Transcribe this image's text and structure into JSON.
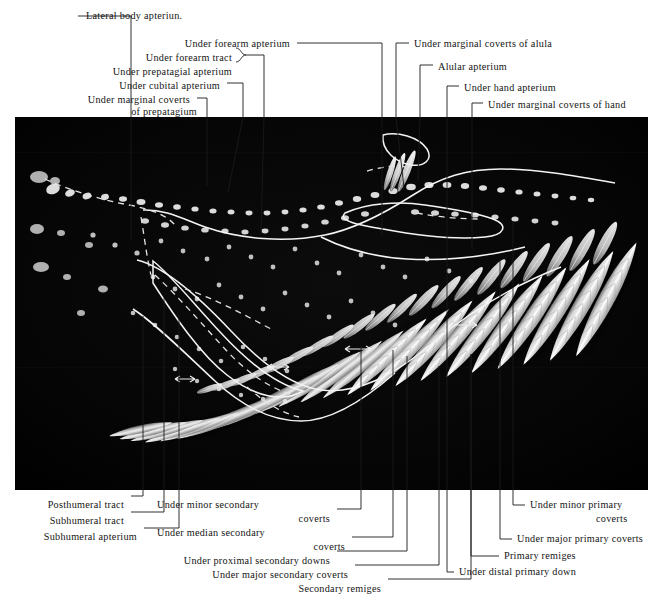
{
  "plate": {
    "domain": "anatomical-photographic-plate",
    "subject": "Underside of a bird wing showing feather tracts and apteria",
    "background_color": "#ffffff",
    "photo_color": "#000000",
    "ink_color": "#141414",
    "photo_rect": {
      "x": 15,
      "y": 117,
      "width": 633,
      "height": 373
    }
  },
  "labels_top": [
    {
      "id": "lateral-body-apterium",
      "text": "Lateral body apteriun.",
      "align": "left",
      "x": 86,
      "y": 10
    },
    {
      "id": "under-forearm-apterium",
      "text": "Under forearm apterium",
      "align": "right",
      "x": 290,
      "y": 38
    },
    {
      "id": "under-forearm-tract",
      "text": "Under forearm tract",
      "align": "right",
      "x": 232,
      "y": 52
    },
    {
      "id": "under-prepatagial-apterium",
      "text": "Under prepatagial apterium",
      "align": "right",
      "x": 232,
      "y": 66
    },
    {
      "id": "under-cubital-apterium",
      "text": "Under cubital apterium",
      "align": "right",
      "x": 220,
      "y": 80
    },
    {
      "id": "under-marginal-coverts-of-prepatagium-1",
      "text": "Under marginal coverts",
      "align": "right",
      "x": 190,
      "y": 94
    },
    {
      "id": "under-marginal-coverts-of-prepatagium-2",
      "text": "of prepatagium",
      "align": "right",
      "x": 200,
      "y": 106
    },
    {
      "id": "under-marginal-coverts-of-alula",
      "text": "Under marginal coverts of alula",
      "align": "left",
      "x": 414,
      "y": 38
    },
    {
      "id": "alular-apterium",
      "text": "Alular apterium",
      "align": "left",
      "x": 438,
      "y": 61
    },
    {
      "id": "under-hand-apterium",
      "text": "Under hand apterium",
      "align": "left",
      "x": 464,
      "y": 82
    },
    {
      "id": "under-marginal-coverts-of-hand",
      "text": "Under marginal coverts of hand",
      "align": "left",
      "x": 488,
      "y": 99
    }
  ],
  "labels_bottom": [
    {
      "id": "posthumeral-tract",
      "text": "Posthumeral tract",
      "align": "right",
      "x": 124,
      "y": 500
    },
    {
      "id": "subhumeral-tract",
      "text": "Subhumeral tract",
      "align": "right",
      "x": 124,
      "y": 516
    },
    {
      "id": "subhumeral-apterium",
      "text": "Subhumeral apterium",
      "align": "right",
      "x": 137,
      "y": 532
    },
    {
      "id": "under-minor-secondary-1",
      "text": "Under minor secondary",
      "align": "left",
      "x": 157,
      "y": 499
    },
    {
      "id": "under-minor-secondary-2",
      "text": "coverts",
      "align": "right",
      "x": 330,
      "y": 513
    },
    {
      "id": "under-median-secondary-1",
      "text": "Under median secondary",
      "align": "left",
      "x": 157,
      "y": 527
    },
    {
      "id": "under-median-secondary-2",
      "text": "coverts",
      "align": "right",
      "x": 345,
      "y": 541
    },
    {
      "id": "under-proximal-secondary-downs",
      "text": "Under proximal secondary downs",
      "align": "right",
      "x": 330,
      "y": 555
    },
    {
      "id": "under-major-secondary-coverts",
      "text": "Under major secondary coverts",
      "align": "right",
      "x": 348,
      "y": 569
    },
    {
      "id": "secondary-remiges",
      "text": "Secondary remiges",
      "align": "right",
      "x": 381,
      "y": 583
    },
    {
      "id": "under-minor-primary-coverts-1",
      "text": "Under minor primary",
      "align": "left",
      "x": 530,
      "y": 500
    },
    {
      "id": "under-minor-primary-coverts-2",
      "text": "coverts",
      "align": "left",
      "x": 596,
      "y": 514
    },
    {
      "id": "under-major-primary-coverts",
      "text": "Under major primary coverts",
      "align": "left",
      "x": 517,
      "y": 534
    },
    {
      "id": "primary-remiges",
      "text": "Primary remiges",
      "align": "left",
      "x": 504,
      "y": 551
    },
    {
      "id": "under-distal-primary-down",
      "text": "Under distal primary down",
      "align": "left",
      "x": 459,
      "y": 567
    }
  ],
  "leaders_top": [
    {
      "id": "leader-lateral-body-apterium",
      "d": "M78,16 L138,16 M138,16 L138,240"
    },
    {
      "id": "leader-under-forearm-apterium",
      "d": "M296,43 L380,43 L380,117 L380,232"
    },
    {
      "id": "leader-brace-forearm",
      "d": "M237,48 q7,0 7,7 q0,7 7,7 q-7,0 -7,7 q0,7 -7,7"
    },
    {
      "id": "leader-forearm-group",
      "d": "M245,62 L264,62 L264,117 L264,230"
    },
    {
      "id": "leader-under-cubital-apterium",
      "d": "M226,85 L241,85 L241,117 L226,190"
    },
    {
      "id": "leader-under-marginal-coverts-prepatagium",
      "d": "M196,99 L205,99 L205,117 L205,185"
    }
  ],
  "leaders_top_right": [
    {
      "id": "leader-under-marginal-coverts-of-alula",
      "d": "M408,43 L396,43 L396,117 L396,185"
    },
    {
      "id": "leader-alular-apterium",
      "d": "M432,66 L419,66 L419,117 L419,176"
    },
    {
      "id": "leader-under-hand-apterium",
      "d": "M458,87 L446,87 L446,117 L446,252"
    },
    {
      "id": "leader-under-marginal-coverts-of-hand",
      "d": "M482,104 L471,104 L471,117 L471,248"
    }
  ],
  "leaders_bottom": [
    {
      "id": "leader-posthumeral-tract",
      "d": "M130,496 L142,496 L142,490 L142,318"
    },
    {
      "id": "leader-subhumeral-tract",
      "d": "M130,512 L163,512 L163,490 L163,300"
    },
    {
      "id": "leader-subhumeral-apterium",
      "d": "M143,528 L178,528 L178,490 L178,318"
    },
    {
      "id": "leader-under-minor-secondary-coverts",
      "d": "M336,509 L360,509 L360,490 L360,346"
    },
    {
      "id": "leader-under-median-secondary-coverts",
      "d": "M351,537 L392,537 L392,490 L392,350"
    },
    {
      "id": "leader-under-proximal-secondary-downs",
      "d": "M336,551 L406,551 L406,490 L406,355"
    },
    {
      "id": "leader-under-major-secondary-coverts",
      "d": "M354,565 L438,565 L438,490 L438,364"
    },
    {
      "id": "leader-secondary-remiges",
      "d": "M387,579 L470,579 L470,490 L470,353"
    }
  ],
  "leaders_bottom_right": [
    {
      "id": "leader-under-minor-primary-coverts",
      "d": "M524,505 L512,505 L512,490 L512,222"
    },
    {
      "id": "leader-under-major-primary-coverts",
      "d": "M511,539 L499,539 L499,490 L499,258"
    },
    {
      "id": "leader-primary-remiges",
      "d": "M498,556 L470,556 L470,490 L470,353"
    },
    {
      "id": "leader-under-distal-primary-down",
      "d": "M453,572 L446,572 L446,490 L446,252"
    }
  ],
  "photo": {
    "tracts": [
      {
        "id": "outline-prepatagium",
        "kind": "solid-outline"
      },
      {
        "id": "outline-forearm-tract",
        "kind": "solid-outline"
      },
      {
        "id": "outline-alula",
        "kind": "solid-outline"
      },
      {
        "id": "outline-hand-apterium",
        "kind": "solid-outline"
      },
      {
        "id": "apterium-dashed-lateral-body",
        "kind": "dashed-outline"
      },
      {
        "id": "apterium-dashed-subhumeral",
        "kind": "dashed-outline"
      }
    ],
    "feather_rows": [
      {
        "id": "primary-remiges",
        "count": 10
      },
      {
        "id": "secondary-remiges",
        "count": 13
      },
      {
        "id": "major-primary-coverts",
        "count": 10
      },
      {
        "id": "major-secondary-coverts",
        "count": 12
      }
    ]
  }
}
